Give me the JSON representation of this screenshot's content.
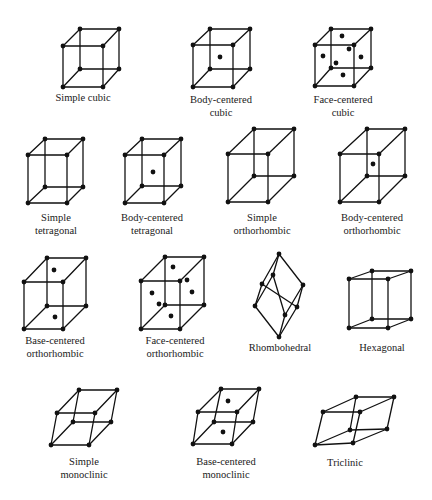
{
  "style": {
    "line_color": "#111111",
    "background": "#ffffff"
  },
  "lattices": [
    {
      "id": "simple-cubic",
      "label_lines": [
        "Simple cubic"
      ],
      "label_x": 83,
      "label_y": [
        101
      ],
      "vertices": [
        [
          80,
          29
        ],
        [
          119,
          29
        ],
        [
          63,
          46
        ],
        [
          103,
          46
        ],
        [
          80,
          69
        ],
        [
          119,
          69
        ],
        [
          63,
          87
        ],
        [
          103,
          87
        ]
      ],
      "edges": "box",
      "extra_atoms": []
    },
    {
      "id": "body-centered-cubic",
      "label_lines": [
        "Body-centered",
        "cubic"
      ],
      "label_x": 221,
      "label_y": [
        103,
        116
      ],
      "vertices": [
        [
          210,
          29
        ],
        [
          250,
          29
        ],
        [
          193,
          45
        ],
        [
          233,
          45
        ],
        [
          210,
          69
        ],
        [
          250,
          69
        ],
        [
          193,
          87
        ],
        [
          233,
          87
        ]
      ],
      "edges": "box",
      "extra_atoms": [
        [
          220,
          57
        ]
      ]
    },
    {
      "id": "face-centered-cubic",
      "label_lines": [
        "Face-centered",
        "cubic"
      ],
      "label_x": 343,
      "label_y": [
        103,
        116
      ],
      "vertices": [
        [
          331,
          29
        ],
        [
          371,
          29
        ],
        [
          315,
          45
        ],
        [
          354,
          45
        ],
        [
          331,
          68
        ],
        [
          371,
          68
        ],
        [
          315,
          86
        ],
        [
          354,
          86
        ]
      ],
      "edges": "box",
      "extra_atoms": [
        [
          342,
          36
        ],
        [
          349,
          49
        ],
        [
          323,
          56
        ],
        [
          361,
          57
        ],
        [
          336,
          63
        ],
        [
          343,
          75
        ]
      ]
    },
    {
      "id": "simple-tetragonal",
      "label_lines": [
        "Simple",
        "tetragonal"
      ],
      "label_x": 56,
      "label_y": [
        221,
        234
      ],
      "vertices": [
        [
          45,
          139
        ],
        [
          83,
          139
        ],
        [
          28,
          155
        ],
        [
          67,
          155
        ],
        [
          45,
          187
        ],
        [
          83,
          187
        ],
        [
          28,
          203
        ],
        [
          67,
          203
        ]
      ],
      "edges": "box",
      "extra_atoms": []
    },
    {
      "id": "body-centered-tetragonal",
      "label_lines": [
        "Body-centered",
        "tetragonal"
      ],
      "label_x": 152,
      "label_y": [
        221,
        234
      ],
      "vertices": [
        [
          142,
          139
        ],
        [
          181,
          139
        ],
        [
          125,
          155
        ],
        [
          164,
          155
        ],
        [
          142,
          186
        ],
        [
          181,
          186
        ],
        [
          125,
          203
        ],
        [
          164,
          203
        ]
      ],
      "edges": "box",
      "extra_atoms": [
        [
          153,
          172
        ]
      ]
    },
    {
      "id": "simple-orthorhombic",
      "label_lines": [
        "Simple",
        "orthorhombic"
      ],
      "label_x": 262,
      "label_y": [
        221,
        234
      ],
      "vertices": [
        [
          254,
          129
        ],
        [
          294,
          129
        ],
        [
          228,
          154
        ],
        [
          268,
          154
        ],
        [
          254,
          176
        ],
        [
          294,
          176
        ],
        [
          228,
          202
        ],
        [
          268,
          202
        ]
      ],
      "edges": "box",
      "extra_atoms": []
    },
    {
      "id": "body-centered-orthorhombic",
      "label_lines": [
        "Body-centered",
        "orthorhombic"
      ],
      "label_x": 372,
      "label_y": [
        221,
        234
      ],
      "vertices": [
        [
          367,
          129
        ],
        [
          405,
          129
        ],
        [
          340,
          154
        ],
        [
          379,
          154
        ],
        [
          367,
          176
        ],
        [
          405,
          176
        ],
        [
          340,
          202
        ],
        [
          379,
          202
        ]
      ],
      "edges": "box",
      "extra_atoms": [
        [
          373,
          164
        ]
      ]
    },
    {
      "id": "base-centered-orthorhombic",
      "label_lines": [
        "Base-centered",
        "orthorhombic"
      ],
      "label_x": 55,
      "label_y": [
        344,
        357
      ],
      "vertices": [
        [
          47,
          258
        ],
        [
          86,
          258
        ],
        [
          24,
          282
        ],
        [
          63,
          282
        ],
        [
          47,
          306
        ],
        [
          86,
          306
        ],
        [
          24,
          329
        ],
        [
          63,
          329
        ]
      ],
      "edges": "box",
      "extra_atoms": [
        [
          54,
          270
        ],
        [
          55,
          317
        ]
      ]
    },
    {
      "id": "face-centered-orthorhombic",
      "label_lines": [
        "Face-centered",
        "orthorhombic"
      ],
      "label_x": 175,
      "label_y": [
        344,
        357
      ],
      "vertices": [
        [
          165,
          257
        ],
        [
          204,
          257
        ],
        [
          141,
          281
        ],
        [
          180,
          281
        ],
        [
          165,
          305
        ],
        [
          204,
          305
        ],
        [
          141,
          329
        ],
        [
          180,
          329
        ]
      ],
      "edges": "box",
      "extra_atoms": [
        [
          173,
          267
        ],
        [
          187,
          280
        ],
        [
          152,
          293
        ],
        [
          192,
          292
        ],
        [
          159,
          304
        ],
        [
          171,
          316
        ]
      ]
    },
    {
      "id": "rhombohedral",
      "label_lines": [
        "Rhombohedral"
      ],
      "label_x": 280,
      "label_y": [
        351
      ],
      "vertices": [
        [
          279,
          254
        ],
        [
          273,
          275
        ],
        [
          262,
          284
        ],
        [
          303,
          285
        ],
        [
          255,
          306
        ],
        [
          297,
          307
        ],
        [
          285,
          315
        ],
        [
          279,
          337
        ]
      ],
      "edges": [
        [
          0,
          1
        ],
        [
          0,
          2
        ],
        [
          0,
          3
        ],
        [
          2,
          4
        ],
        [
          1,
          6
        ],
        [
          2,
          5
        ],
        [
          3,
          5
        ],
        [
          3,
          6
        ],
        [
          4,
          7
        ],
        [
          5,
          7
        ],
        [
          6,
          7
        ],
        [
          1,
          4
        ]
      ],
      "extra_atoms": []
    },
    {
      "id": "hexagonal",
      "label_lines": [
        "Hexagonal"
      ],
      "label_x": 382,
      "label_y": [
        351
      ],
      "vertices": [
        [
          372,
          271
        ],
        [
          411,
          271
        ],
        [
          349,
          279
        ],
        [
          388,
          279
        ],
        [
          372,
          319
        ],
        [
          411,
          319
        ],
        [
          349,
          328
        ],
        [
          388,
          328
        ]
      ],
      "edges": "box",
      "extra_atoms": []
    },
    {
      "id": "simple-monoclinic",
      "label_lines": [
        "Simple",
        "monoclinic"
      ],
      "label_x": 84,
      "label_y": [
        465,
        478
      ],
      "vertices": [
        [
          79,
          390
        ],
        [
          117,
          390
        ],
        [
          57,
          413
        ],
        [
          95,
          413
        ],
        [
          73,
          422
        ],
        [
          111,
          422
        ],
        [
          51,
          445
        ],
        [
          89,
          445
        ]
      ],
      "edges": "box",
      "extra_atoms": []
    },
    {
      "id": "base-centered-monoclinic",
      "label_lines": [
        "Base-centered",
        "monoclinic"
      ],
      "label_x": 226,
      "label_y": [
        465,
        478
      ],
      "vertices": [
        [
          221,
          389
        ],
        [
          259,
          389
        ],
        [
          198,
          412
        ],
        [
          237,
          412
        ],
        [
          214,
          422
        ],
        [
          253,
          422
        ],
        [
          193,
          444
        ],
        [
          232,
          444
        ]
      ],
      "edges": "box",
      "extra_atoms": [
        [
          228,
          401
        ],
        [
          223,
          432
        ]
      ]
    },
    {
      "id": "triclinic",
      "label_lines": [
        "Triclinic"
      ],
      "label_x": 345,
      "label_y": [
        466
      ],
      "vertices": [
        [
          356,
          397
        ],
        [
          394,
          397
        ],
        [
          323,
          412
        ],
        [
          360,
          412
        ],
        [
          350,
          430
        ],
        [
          387,
          429
        ],
        [
          315,
          445
        ],
        [
          353,
          443
        ]
      ],
      "edges": "box",
      "extra_atoms": []
    }
  ]
}
